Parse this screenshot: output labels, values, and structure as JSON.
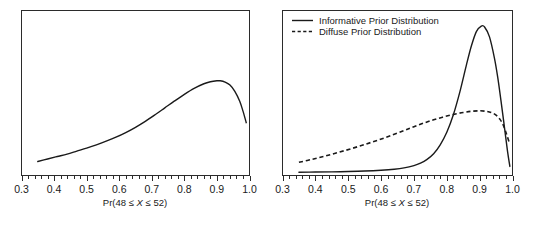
{
  "figure": {
    "title": "",
    "panel_count": 2
  },
  "chart_data": [
    {
      "type": "line",
      "panel": "left",
      "title": "",
      "xlabel_parts": {
        "prefix": "Pr(48 ",
        "le1": "≤ ",
        "variable": "X",
        "le2": " ≤ ",
        "suffix": "52)"
      },
      "xlabel": "Pr(48 ≤ X ≤ 52)",
      "ylabel": "",
      "xlim": [
        0.3,
        1.0
      ],
      "ylim": [
        0,
        1
      ],
      "xticks": [
        0.3,
        0.4,
        0.5,
        0.6,
        0.7,
        0.8,
        0.9,
        1.0
      ],
      "xticklabels": [
        "0.3",
        "0.4",
        "0.5",
        "0.6",
        "0.7",
        "0.8",
        "0.9",
        "1.0"
      ],
      "minor_ticks_between": 4,
      "yaxis_visible": false,
      "grid": false,
      "legend": null,
      "series": [
        {
          "name": "Posterior Distribution",
          "style": "solid",
          "x": [
            0.35,
            0.38,
            0.41,
            0.44,
            0.47,
            0.5,
            0.53,
            0.56,
            0.59,
            0.62,
            0.65,
            0.68,
            0.71,
            0.74,
            0.77,
            0.8,
            0.83,
            0.86,
            0.88,
            0.9,
            0.91,
            0.925,
            0.94,
            0.955,
            0.97,
            0.98,
            0.99
          ],
          "y": [
            0.085,
            0.1,
            0.115,
            0.13,
            0.148,
            0.166,
            0.186,
            0.208,
            0.232,
            0.26,
            0.292,
            0.328,
            0.368,
            0.41,
            0.452,
            0.492,
            0.528,
            0.556,
            0.568,
            0.574,
            0.574,
            0.566,
            0.548,
            0.51,
            0.45,
            0.39,
            0.32
          ]
        }
      ]
    },
    {
      "type": "line",
      "panel": "right",
      "title": "",
      "xlabel_parts": {
        "prefix": "Pr(48 ",
        "le1": "≤ ",
        "variable": "X",
        "le2": " ≤ ",
        "suffix": "52)"
      },
      "xlabel": "Pr(48 ≤ X ≤ 52)",
      "ylabel": "",
      "xlim": [
        0.3,
        1.0
      ],
      "ylim": [
        0,
        1
      ],
      "xticks": [
        0.3,
        0.4,
        0.5,
        0.6,
        0.7,
        0.8,
        0.9,
        1.0
      ],
      "xticklabels": [
        "0.3",
        "0.4",
        "0.5",
        "0.6",
        "0.7",
        "0.8",
        "0.9",
        "1.0"
      ],
      "minor_ticks_between": 4,
      "yaxis_visible": false,
      "grid": false,
      "legend": {
        "position": "top-left",
        "entries": [
          {
            "label": "Informative Prior Distribution",
            "style": "solid"
          },
          {
            "label": "Diffuse Prior Distribution",
            "style": "dashed"
          }
        ]
      },
      "series": [
        {
          "name": "Informative Prior Distribution",
          "style": "solid",
          "x": [
            0.35,
            0.4,
            0.45,
            0.5,
            0.55,
            0.6,
            0.64,
            0.67,
            0.7,
            0.72,
            0.74,
            0.76,
            0.78,
            0.8,
            0.82,
            0.84,
            0.86,
            0.875,
            0.89,
            0.905,
            0.915,
            0.93,
            0.945,
            0.955,
            0.965,
            0.975,
            0.985,
            0.992
          ],
          "y": [
            0.02,
            0.021,
            0.022,
            0.024,
            0.027,
            0.032,
            0.038,
            0.046,
            0.06,
            0.075,
            0.098,
            0.132,
            0.186,
            0.262,
            0.368,
            0.508,
            0.672,
            0.786,
            0.872,
            0.905,
            0.9,
            0.84,
            0.712,
            0.596,
            0.452,
            0.3,
            0.145,
            0.055
          ]
        },
        {
          "name": "Diffuse Prior Distribution",
          "style": "dashed",
          "x": [
            0.35,
            0.39,
            0.43,
            0.47,
            0.51,
            0.55,
            0.59,
            0.63,
            0.67,
            0.7,
            0.73,
            0.76,
            0.79,
            0.82,
            0.85,
            0.875,
            0.9,
            0.92,
            0.935,
            0.95,
            0.962,
            0.972,
            0.982,
            0.99
          ],
          "y": [
            0.08,
            0.098,
            0.118,
            0.14,
            0.163,
            0.188,
            0.214,
            0.242,
            0.272,
            0.296,
            0.318,
            0.338,
            0.355,
            0.37,
            0.382,
            0.389,
            0.392,
            0.389,
            0.382,
            0.366,
            0.34,
            0.305,
            0.25,
            0.2
          ]
        }
      ]
    }
  ]
}
